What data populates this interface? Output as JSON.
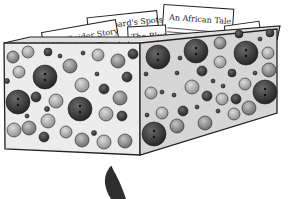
{
  "illustration": {
    "subject": "polka-dot story box",
    "cards": [
      {
        "title": "The Spider Story"
      },
      {
        "title": "Leopard's Spots",
        "visible_text": "opard's Spots"
      },
      {
        "title": "The Blue",
        "visible_text": "The Blue"
      },
      {
        "title": "An African Tale"
      }
    ],
    "colors": {
      "box_face": "#ececec",
      "box_side": "#d6d6d6",
      "outline": "#222222",
      "dot_dark": "#3a3a3a",
      "dot_mid": "#8a8a8a",
      "dot_light": "#b4b4b4",
      "feather": "#2e2e2e"
    },
    "below_box": "dark feather / hand shape"
  }
}
